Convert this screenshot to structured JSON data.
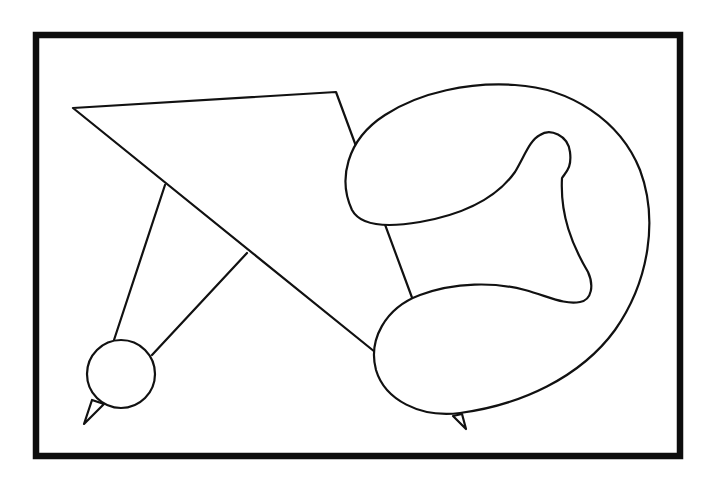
{
  "figure": {
    "background_color": "#ffffff",
    "stroke_color": "#111111",
    "frame": {
      "x": 36,
      "y": 35,
      "width": 644,
      "height": 421
    },
    "shapes": [
      {
        "name": "large-quadrilateral",
        "kind": "polygon"
      },
      {
        "name": "left-strut",
        "kind": "line"
      },
      {
        "name": "right-strut",
        "kind": "line"
      },
      {
        "name": "small-circle",
        "kind": "circle"
      },
      {
        "name": "circle-spike",
        "kind": "triangle"
      },
      {
        "name": "curled-loop-blob",
        "kind": "closed-curve"
      },
      {
        "name": "blob-spike",
        "kind": "triangle"
      }
    ]
  }
}
